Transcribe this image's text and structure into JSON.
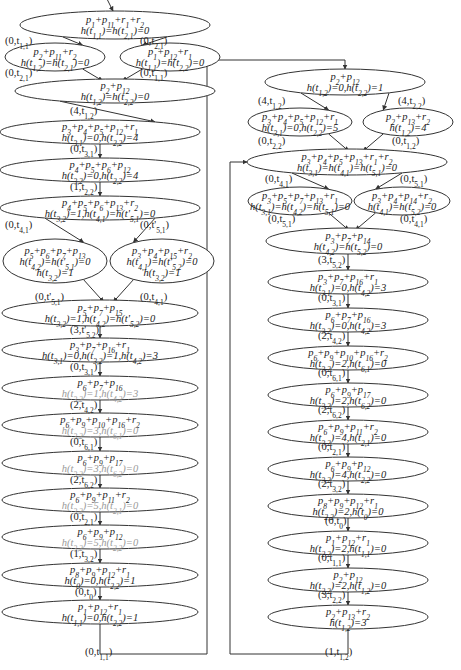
{
  "nodes": [
    {
      "id": "L1",
      "x": 115,
      "y": 25,
      "rx": 95,
      "ry": 14,
      "lines": [
        "p1+p11+r1+r2",
        "h(t1,1)=h(t2,1)=0"
      ]
    },
    {
      "id": "L2a",
      "x": 55,
      "y": 57,
      "rx": 50,
      "ry": 14,
      "lines": [
        "p2+p11+r2",
        "h(t1,2)=h(t2,1)=0"
      ]
    },
    {
      "id": "L2b",
      "x": 170,
      "y": 57,
      "rx": 50,
      "ry": 14,
      "lines": [
        "p1+p12+r1",
        "h(t1,1)=h(t2,2)=0"
      ]
    },
    {
      "id": "L3",
      "x": 115,
      "y": 91,
      "rx": 100,
      "ry": 12,
      "lines": [
        "p2+p12",
        "h(t1,2)=h(t2,2)=0"
      ]
    },
    {
      "id": "L4",
      "x": 100,
      "y": 132,
      "rx": 100,
      "ry": 12,
      "lines": [
        "p3+p4+p5+p12+r1",
        "h(t3,1)=0,h(t2,2)=4"
      ]
    },
    {
      "id": "L5",
      "x": 100,
      "y": 170,
      "rx": 100,
      "ry": 12,
      "lines": [
        "p4+p5+p6+p12",
        "h(t3,2)=0,h(t2,2)=4"
      ]
    },
    {
      "id": "L6",
      "x": 100,
      "y": 208,
      "rx": 100,
      "ry": 12,
      "lines": [
        "p4+p5+p6+p13+r2",
        "h(t3,2)=1,h(t4,1)=h(t'5,1)=0"
      ]
    },
    {
      "id": "L7a",
      "x": 55,
      "y": 261,
      "rx": 52,
      "ry": 22,
      "lines": [
        "p5+p6+p7+p13",
        "h(t4,2)=h(t'5,1)=0",
        "h(t3,2)=1"
      ]
    },
    {
      "id": "L7b",
      "x": 162,
      "y": 261,
      "rx": 52,
      "ry": 22,
      "lines": [
        "p3+p4+p15+r2",
        "h(t4,1)=h(t'5,2)=0",
        "h(t3,2)=1"
      ]
    },
    {
      "id": "L8",
      "x": 100,
      "y": 313,
      "rx": 98,
      "ry": 13,
      "lines": [
        "p5+p7+p15",
        "h(t3,2)=1,h(t4,2)=h(t'5,2)=0"
      ]
    },
    {
      "id": "L9",
      "x": 100,
      "y": 350,
      "rx": 98,
      "ry": 12,
      "lines": [
        "p3+p7+p16+r1",
        "h(t3,1)=0,h(t3,2)=1,h(t4,2)=3"
      ]
    },
    {
      "id": "L10",
      "x": 100,
      "y": 388,
      "rx": 98,
      "ry": 12,
      "lines": [
        "p6+p7+p16",
        "h(t3,2)=1,h(t4,2)=3"
      ],
      "grey": [
        1
      ]
    },
    {
      "id": "L11",
      "x": 100,
      "y": 425,
      "rx": 98,
      "ry": 12,
      "lines": [
        "p6+p9+p10+p16+r2",
        "h(t3,2)=3,h(t6,1)=0"
      ],
      "grey": [
        1
      ]
    },
    {
      "id": "L12",
      "x": 100,
      "y": 463,
      "rx": 98,
      "ry": 12,
      "lines": [
        "p6+p9+p17",
        "h(t3,2)=3,h(t6,2)=0"
      ],
      "grey": [
        1
      ]
    },
    {
      "id": "L13",
      "x": 100,
      "y": 500,
      "rx": 98,
      "ry": 12,
      "lines": [
        "p6+p9+p11+r2",
        "h(t3,2)=5,h(t2,1)=0"
      ],
      "grey": [
        1
      ]
    },
    {
      "id": "L14",
      "x": 100,
      "y": 537,
      "rx": 98,
      "ry": 12,
      "lines": [
        "p6+p9+p12",
        "h(t3,2)=5,h(t2,2)=0"
      ],
      "grey": [
        1
      ]
    },
    {
      "id": "L15",
      "x": 100,
      "y": 575,
      "rx": 98,
      "ry": 12,
      "lines": [
        "p8+p9+p12+r1",
        "h(t0)=0,h(t2,2)=1"
      ]
    },
    {
      "id": "L16",
      "x": 100,
      "y": 612,
      "rx": 98,
      "ry": 12,
      "lines": [
        "p1+p12+r1",
        "h(t1,1)=0,h(t2,2)=1"
      ]
    },
    {
      "id": "R1",
      "x": 345,
      "y": 82,
      "rx": 80,
      "ry": 13,
      "lines": [
        "p2+p12",
        "h(t1,2)=0,h(t2,2)=1"
      ]
    },
    {
      "id": "R2a",
      "x": 300,
      "y": 122,
      "rx": 52,
      "ry": 14,
      "lines": [
        "p3+p4+p5+p12+r1",
        "h(t3,1)=0,h(t2,2)=5"
      ]
    },
    {
      "id": "R2b",
      "x": 408,
      "y": 122,
      "rx": 45,
      "ry": 14,
      "lines": [
        "p2+p13+r2",
        "h(t1,2)=4"
      ]
    },
    {
      "id": "R3",
      "x": 347,
      "y": 162,
      "rx": 100,
      "ry": 13,
      "lines": [
        "p3+p4+p5+p13+r1+r2",
        "h(t3,1)=h(t4,1)=h(t5,1)=0"
      ]
    },
    {
      "id": "R4a",
      "x": 300,
      "y": 201,
      "rx": 52,
      "ry": 14,
      "lines": [
        "p3+p5+p7+p13+r1",
        "h(t3,1)=h(t4,2)=h(t5,1)=0"
      ]
    },
    {
      "id": "R4b",
      "x": 402,
      "y": 201,
      "rx": 48,
      "ry": 14,
      "lines": [
        "p3+p4+p14+r2",
        "h(t4,1)=h(t5,2)=0"
      ]
    },
    {
      "id": "R5",
      "x": 348,
      "y": 241,
      "rx": 82,
      "ry": 13,
      "lines": [
        "p3+p7+p14",
        "h(t4,2)=h(t5,2)=0"
      ]
    },
    {
      "id": "R6",
      "x": 348,
      "y": 282,
      "rx": 80,
      "ry": 12,
      "lines": [
        "p3+p7+p16+r1",
        "h(t3,1)=0,h(t4,2)=3"
      ]
    },
    {
      "id": "R7",
      "x": 348,
      "y": 320,
      "rx": 80,
      "ry": 12,
      "lines": [
        "p6+p7+p16",
        "h(t3,2)=0,h(t4,2)=3"
      ]
    },
    {
      "id": "R8",
      "x": 348,
      "y": 358,
      "rx": 80,
      "ry": 12,
      "lines": [
        "p6+p9+p10+p16+r2",
        "h(t3,2)=2,h(t6,1)=0"
      ]
    },
    {
      "id": "R9",
      "x": 348,
      "y": 395,
      "rx": 80,
      "ry": 12,
      "lines": [
        "p6+p9+p17",
        "h(t3,2)=2,h(t6,2)=0"
      ]
    },
    {
      "id": "R10",
      "x": 348,
      "y": 432,
      "rx": 80,
      "ry": 12,
      "lines": [
        "p6+p9+p11+r2",
        "h(t3,2)=4,h(t2,1)=0"
      ]
    },
    {
      "id": "R11",
      "x": 348,
      "y": 469,
      "rx": 80,
      "ry": 12,
      "lines": [
        "p6+p9+p12",
        "h(t3,2)=4,h(t2,2)=0"
      ]
    },
    {
      "id": "R12",
      "x": 348,
      "y": 506,
      "rx": 80,
      "ry": 12,
      "lines": [
        "p8+p9+p12+r1",
        "h(t2,2)=2,h(t0)=0"
      ]
    },
    {
      "id": "R13",
      "x": 348,
      "y": 543,
      "rx": 80,
      "ry": 12,
      "lines": [
        "p1+p12+r1",
        "h(t2,2)=2,h(t1,1)=0"
      ]
    },
    {
      "id": "R14",
      "x": 348,
      "y": 580,
      "rx": 80,
      "ry": 12,
      "lines": [
        "p2+p12",
        "h(t2,2)=2,h(t1,2)=0"
      ]
    },
    {
      "id": "R15",
      "x": 348,
      "y": 617,
      "rx": 80,
      "ry": 12,
      "lines": [
        "p2+p13+r2",
        "h(t1,2)=3"
      ]
    }
  ],
  "edges": [
    {
      "from": "L1",
      "to": "L2a",
      "label": "(0,t1,1)",
      "lx": 5,
      "ly": 44
    },
    {
      "from": "L1",
      "to": "L2b",
      "label": "(0,t2,1)",
      "lx": 140,
      "ly": 44
    },
    {
      "from": "L2a",
      "to": "L3",
      "label": "(0,t2,1)",
      "lx": 5,
      "ly": 76
    },
    {
      "from": "L2b",
      "to": "L3",
      "label": "(0,t1,1)",
      "lx": 140,
      "ly": 76
    },
    {
      "from": "L3",
      "to": "L4",
      "label": "(4,t1,2)",
      "lx": 70,
      "ly": 114
    },
    {
      "from": "L4",
      "to": "L5",
      "label": "(0,t3,1)",
      "lx": 70,
      "ly": 152
    },
    {
      "from": "L5",
      "to": "L6",
      "label": "(1,t2,2)",
      "lx": 70,
      "ly": 190
    },
    {
      "from": "L6",
      "to": "L7a",
      "label": "(0,t4,1)",
      "lx": 5,
      "ly": 228
    },
    {
      "from": "L6",
      "to": "L7b",
      "label": "(0,t'5,1)",
      "lx": 140,
      "ly": 228
    },
    {
      "from": "L7a",
      "to": "L8",
      "label": "(0,t'5,1)",
      "lx": 35,
      "ly": 300
    },
    {
      "from": "L7b",
      "to": "L8",
      "label": "(0,t4,1)",
      "lx": 140,
      "ly": 300
    },
    {
      "from": "L8",
      "to": "L9",
      "label": "(3,t'5,2)",
      "lx": 70,
      "ly": 333
    },
    {
      "from": "L9",
      "to": "L10",
      "label": "(0,t3,1)",
      "lx": 70,
      "ly": 370
    },
    {
      "from": "L10",
      "to": "L11",
      "label": "(2,t4,2)",
      "lx": 70,
      "ly": 408
    },
    {
      "from": "L11",
      "to": "L12",
      "label": "(0,t6,1)",
      "lx": 70,
      "ly": 445
    },
    {
      "from": "L12",
      "to": "L13",
      "label": "(2,t6,2)",
      "lx": 70,
      "ly": 483
    },
    {
      "from": "L13",
      "to": "L14",
      "label": "(0,t2,1)",
      "lx": 70,
      "ly": 520
    },
    {
      "from": "L14",
      "to": "L15",
      "label": "(1,t3,2)",
      "lx": 70,
      "ly": 557
    },
    {
      "from": "L15",
      "to": "L16",
      "label": "(0,t0)",
      "lx": 75,
      "ly": 595
    },
    {
      "from": "L16",
      "to": "R1",
      "label": "(0,t1,1)",
      "lx": 85,
      "ly": 655
    },
    {
      "from": "R1",
      "to": "R2a",
      "label": "(4,t1,2)",
      "lx": 258,
      "ly": 104
    },
    {
      "from": "R1",
      "to": "R2b",
      "label": "(4,t2,2)",
      "lx": 398,
      "ly": 104
    },
    {
      "from": "R2a",
      "to": "R3",
      "label": "(0,t2,2)",
      "lx": 258,
      "ly": 144
    },
    {
      "from": "R2b",
      "to": "R3",
      "label": "(0,t1,2)",
      "lx": 392,
      "ly": 144
    },
    {
      "from": "R3",
      "to": "R4a",
      "label": "(0,t4,1)",
      "lx": 265,
      "ly": 182
    },
    {
      "from": "R3",
      "to": "R4b",
      "label": "(0,t5,1)",
      "lx": 400,
      "ly": 182
    },
    {
      "from": "R4a",
      "to": "R5",
      "label": "(0,t5,1)",
      "lx": 268,
      "ly": 222
    },
    {
      "from": "R4b",
      "to": "R5",
      "label": "(0,t4,1)",
      "lx": 400,
      "ly": 222
    },
    {
      "from": "R5",
      "to": "R6",
      "label": "(3,t5,2)",
      "lx": 318,
      "ly": 263
    },
    {
      "from": "R6",
      "to": "R7",
      "label": "(0,t3,1)",
      "lx": 318,
      "ly": 301
    },
    {
      "from": "R7",
      "to": "R8",
      "label": "(2,t4,2)",
      "lx": 318,
      "ly": 339
    },
    {
      "from": "R8",
      "to": "R9",
      "label": "(0,t6,1)",
      "lx": 318,
      "ly": 376
    },
    {
      "from": "R9",
      "to": "R10",
      "label": "(2,t6,2)",
      "lx": 318,
      "ly": 413
    },
    {
      "from": "R10",
      "to": "R11",
      "label": "(0,t2,1)",
      "lx": 318,
      "ly": 450
    },
    {
      "from": "R11",
      "to": "R12",
      "label": "(2,t3,2)",
      "lx": 318,
      "ly": 487
    },
    {
      "from": "R12",
      "to": "R13",
      "label": "(0,t0)",
      "lx": 325,
      "ly": 524
    },
    {
      "from": "R13",
      "to": "R14",
      "label": "(0,t1,1)",
      "lx": 318,
      "ly": 561
    },
    {
      "from": "R14",
      "to": "R15",
      "label": "(3,t2,2)",
      "lx": 318,
      "ly": 598
    },
    {
      "from": "R15",
      "to": "R3",
      "label": "(1,t1,2)",
      "lx": 325,
      "ly": 655
    }
  ]
}
